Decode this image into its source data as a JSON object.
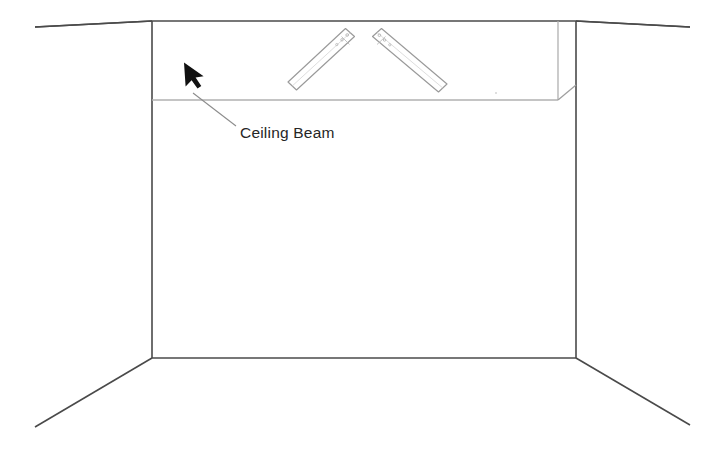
{
  "document": {
    "title": "Ceiling Beam Diagram",
    "background_color": "#ffffff",
    "width": 722,
    "height": 451
  },
  "annotation": {
    "label": "Ceiling Beam",
    "label_position": {
      "x": 240,
      "y": 137
    },
    "arrow_tip": {
      "x": 184,
      "y": 83
    },
    "leader_line": {
      "x1": 192,
      "y1": 92,
      "x2": 236,
      "y2": 126
    },
    "arrow_color": "#111111",
    "leader_color": "#888888",
    "text_color": "#262626"
  },
  "room": {
    "line_color": "#4a4a4a",
    "light_line_color": "#b9b9b9",
    "back_wall": {
      "name": "back-wall-rectangle",
      "top_left": {
        "x": 152,
        "y": 21
      },
      "top_right": {
        "x": 576,
        "y": 21
      },
      "bottom_right": {
        "x": 576,
        "y": 358
      },
      "bottom_left": {
        "x": 152,
        "y": 358
      }
    },
    "perspective_lines": [
      {
        "name": "ceiling-left-edge",
        "x1": 152,
        "y1": 21,
        "x2": 35,
        "y2": 27
      },
      {
        "name": "ceiling-right-edge",
        "x1": 576,
        "y1": 21,
        "x2": 690,
        "y2": 27
      },
      {
        "name": "floor-left-edge",
        "x1": 152,
        "y1": 358,
        "x2": 35,
        "y2": 427
      },
      {
        "name": "floor-right-edge",
        "x1": 576,
        "y1": 358,
        "x2": 690,
        "y2": 425
      }
    ],
    "side_walls": [
      {
        "name": "left-wall-upper",
        "x1": 35,
        "y1": 27,
        "x2": 152,
        "y2": 21
      },
      {
        "name": "right-wall-upper",
        "x1": 576,
        "y1": 21,
        "x2": 690,
        "y2": 27
      }
    ]
  },
  "ceiling_beam": {
    "name": "ceiling-beam-soffit",
    "front_face_line": {
      "x1": 152,
      "y1": 100,
      "x2": 558,
      "y2": 100
    },
    "return_edge": {
      "x1": 558,
      "y1": 100,
      "x2": 576,
      "y2": 85
    },
    "right_vertical": {
      "x1": 558,
      "y1": 21,
      "x2": 558,
      "y2": 100
    },
    "line_color": "#b0b0b0",
    "faint_mark": {
      "x": 496,
      "y": 93
    }
  },
  "rods": [
    {
      "name": "diagonal-rod-left",
      "start": {
        "x": 350,
        "y": 32
      },
      "end": {
        "x": 292,
        "y": 86
      },
      "width": 9,
      "detail_holes": 3,
      "stroke": "#9a9a9a"
    },
    {
      "name": "diagonal-rod-right",
      "start": {
        "x": 377,
        "y": 32
      },
      "end": {
        "x": 443,
        "y": 88
      },
      "width": 9,
      "detail_holes": 3,
      "stroke": "#9a9a9a"
    }
  ]
}
